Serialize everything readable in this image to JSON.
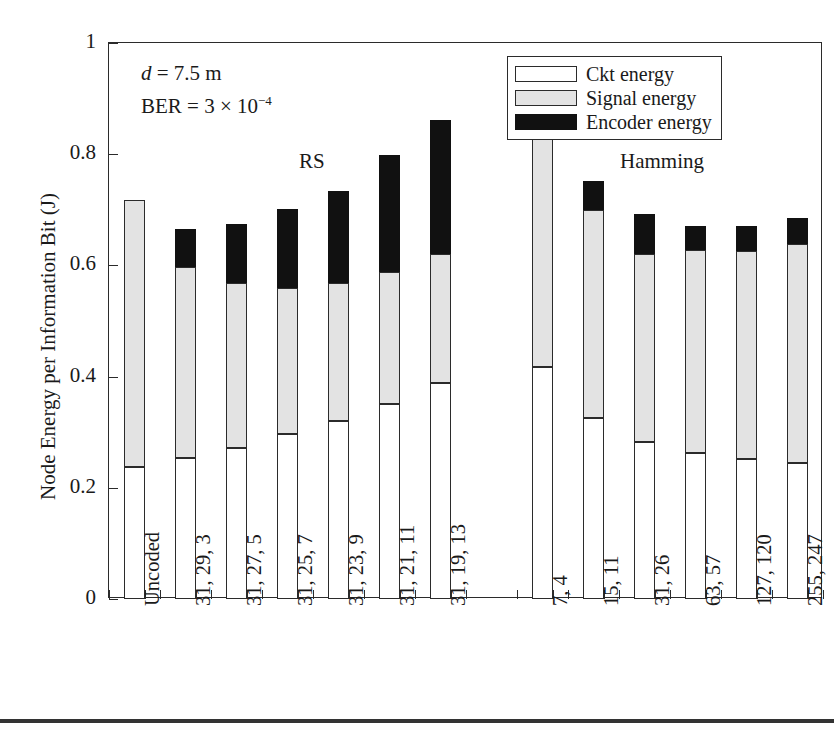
{
  "chart_data": {
    "type": "bar",
    "subtype": "stacked-bar",
    "title": "",
    "xlabel": "",
    "ylabel": "Node Energy per Information Bit (J)",
    "ylim": [
      0,
      1
    ],
    "yticks": [
      "0",
      "0.2",
      "0.4",
      "0.6",
      "0.8",
      "1"
    ],
    "ytick_values": [
      0,
      0.2,
      0.4,
      0.6,
      0.8,
      1
    ],
    "grid": false,
    "legend_position": "top-right",
    "categories": [
      "Uncoded",
      "31, 29, 3",
      "31, 27, 5",
      "31, 25, 7",
      "31, 23, 9",
      "31, 21, 11",
      "31, 19, 13",
      "7, 4",
      "15, 11",
      "31, 26",
      "63, 57",
      "127, 120",
      "255, 247"
    ],
    "series": [
      {
        "name": "Ckt energy",
        "color": "#ffffff",
        "values": [
          0.237,
          0.253,
          0.272,
          0.296,
          0.321,
          0.35,
          0.389,
          0.418,
          0.325,
          0.283,
          0.262,
          0.251,
          0.245
        ]
      },
      {
        "name": "Signal energy",
        "color": "#e3e3e3",
        "values": [
          0.481,
          0.345,
          0.297,
          0.263,
          0.247,
          0.238,
          0.231,
          0.415,
          0.375,
          0.337,
          0.365,
          0.375,
          0.393
        ]
      },
      {
        "name": "Encoder energy",
        "color": "#111111",
        "values": [
          0.0,
          0.068,
          0.106,
          0.142,
          0.165,
          0.21,
          0.241,
          0.072,
          0.051,
          0.072,
          0.044,
          0.045,
          0.047
        ]
      }
    ],
    "totals": [
      0.718,
      0.666,
      0.675,
      0.701,
      0.733,
      0.798,
      0.861,
      0.905,
      0.751,
      0.692,
      0.671,
      0.671,
      0.685
    ],
    "annotations": [
      {
        "name": "group-rs",
        "text": "RS",
        "x_category_span": [
          1,
          6
        ]
      },
      {
        "name": "group-hamming",
        "text": "Hamming",
        "x_category_span": [
          7,
          12
        ]
      }
    ]
  },
  "legend": {
    "items": [
      {
        "label": "Ckt energy",
        "swatch": "white-swatch"
      },
      {
        "label": "Signal energy",
        "swatch": "light-gray-swatch"
      },
      {
        "label": "Encoder energy",
        "swatch": "black-swatch"
      }
    ]
  },
  "parameters": {
    "distance_label": "d",
    "distance_eq": " = 7.5 m",
    "ber_label": "BER = 3 × 10",
    "ber_exponent": "−4"
  },
  "groups": {
    "rs": "RS",
    "hamming": "Hamming"
  },
  "colors": {
    "ckt": "#ffffff",
    "signal": "#e3e3e3",
    "encoder": "#111111",
    "axis": "#2b2b2b",
    "text": "#1a1a1a"
  }
}
